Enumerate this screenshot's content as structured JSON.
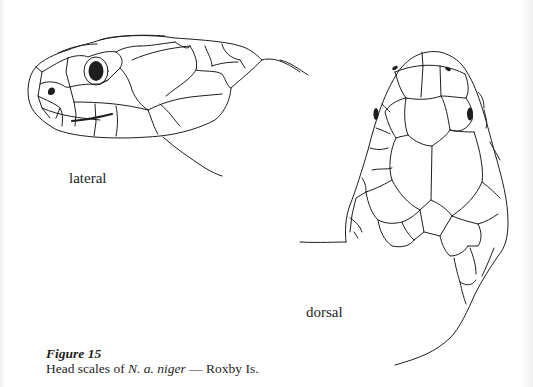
{
  "figure": {
    "number_label": "Figure 15",
    "caption_prefix": "Head scales of ",
    "caption_taxon": "N. a. niger",
    "caption_suffix": " — Roxby Is.",
    "views": {
      "lateral": {
        "label": "lateral"
      },
      "dorsal": {
        "label": "dorsal"
      }
    }
  },
  "colors": {
    "ink": "#1e1e1e",
    "paper": "#ffffff"
  }
}
